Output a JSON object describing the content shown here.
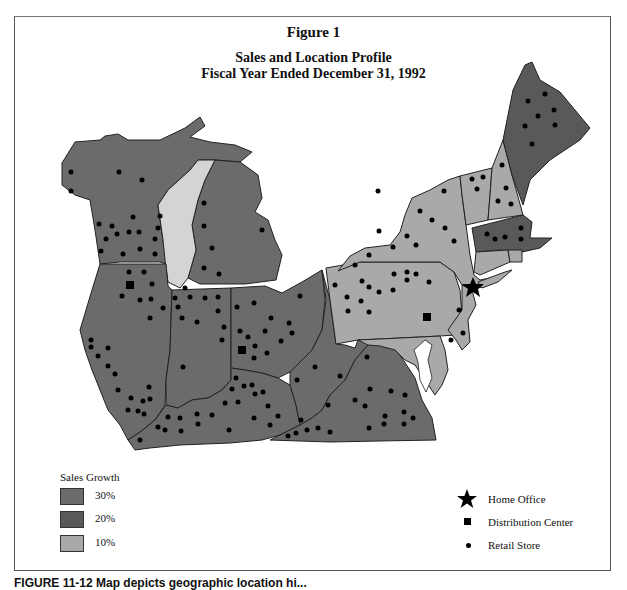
{
  "figure": {
    "label": "Figure 1",
    "title": "Sales and Location Profile",
    "subtitle": "Fiscal Year Ended December 31, 1992"
  },
  "legend_growth": {
    "title": "Sales Growth",
    "items": [
      {
        "label": "30%",
        "color": "#6b6b6b"
      },
      {
        "label": "20%",
        "color": "#595959"
      },
      {
        "label": "10%",
        "color": "#a9a9a9"
      }
    ]
  },
  "legend_symbols": {
    "items": [
      {
        "icon": "star-icon",
        "label": "Home Office"
      },
      {
        "icon": "square-icon",
        "label": "Distribution Center"
      },
      {
        "icon": "dot-icon",
        "label": "Retail Store"
      }
    ]
  },
  "map": {
    "lake_color": "#d4d4d4",
    "border_color": "#222222",
    "regions": [
      {
        "name": "Wisconsin",
        "growth": "30%"
      },
      {
        "name": "Michigan",
        "growth": "30%"
      },
      {
        "name": "Illinois",
        "growth": "30%"
      },
      {
        "name": "Indiana",
        "growth": "30%"
      },
      {
        "name": "Ohio",
        "growth": "30%"
      },
      {
        "name": "Kentucky",
        "growth": "30%"
      },
      {
        "name": "West Virginia",
        "growth": "30%"
      },
      {
        "name": "Virginia",
        "growth": "30%"
      },
      {
        "name": "Maine",
        "growth": "20%"
      },
      {
        "name": "Massachusetts",
        "growth": "20%"
      },
      {
        "name": "New York",
        "growth": "10%"
      },
      {
        "name": "Pennsylvania",
        "growth": "10%"
      },
      {
        "name": "Vermont",
        "growth": "10%"
      },
      {
        "name": "New Hampshire",
        "growth": "10%"
      },
      {
        "name": "Connecticut",
        "growth": "10%"
      },
      {
        "name": "Rhode Island",
        "growth": "10%"
      },
      {
        "name": "New Jersey",
        "growth": "10%"
      },
      {
        "name": "Delaware",
        "growth": "10%"
      },
      {
        "name": "Maryland",
        "growth": "10%"
      }
    ]
  },
  "caption": "FIGURE 11-12   Map depicts geographic location hi..."
}
